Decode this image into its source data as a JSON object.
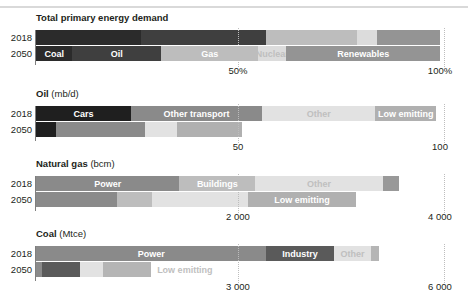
{
  "figure": {
    "rows": [
      "2018",
      "2050"
    ],
    "plot_left_px": 36,
    "plot_width_px": 404
  },
  "chart_data": [
    {
      "type": "bar",
      "orientation": "horizontal",
      "stacked": true,
      "title": "Total primary energy demand",
      "unit": "",
      "xlabel": "",
      "ylabel": "",
      "xlim": [
        0,
        100
      ],
      "ticks": [
        {
          "value": 50,
          "label": "50%"
        },
        {
          "value": 100,
          "label": "100%"
        }
      ],
      "grid": true,
      "categories": [
        "2018",
        "2050"
      ],
      "series": [
        {
          "name": "Coal",
          "values": [
            26.0,
            9.0
          ],
          "color": "#2b2b2b"
        },
        {
          "name": "Oil",
          "values": [
            31.0,
            22.0
          ],
          "color": "#3f3f3f"
        },
        {
          "name": "Gas",
          "values": [
            22.5,
            24.0
          ],
          "color": "#bdbdbd"
        },
        {
          "name": "Nuclear",
          "values": [
            5.0,
            7.0
          ],
          "color": "#dcdcdc"
        },
        {
          "name": "Renewables",
          "values": [
            15.5,
            38.0
          ],
          "color": "#949494"
        }
      ]
    },
    {
      "type": "bar",
      "orientation": "horizontal",
      "stacked": true,
      "title": "Oil",
      "unit": "(mb/d)",
      "xlabel": "",
      "ylabel": "",
      "xlim": [
        0,
        100
      ],
      "ticks": [
        {
          "value": 50,
          "label": "50"
        },
        {
          "value": 100,
          "label": "100"
        }
      ],
      "grid": true,
      "categories": [
        "2018",
        "2050"
      ],
      "series": [
        {
          "name": "Cars",
          "values": [
            23.5,
            5.0
          ],
          "color": "#1f1f1f"
        },
        {
          "name": "Other transport",
          "values": [
            32.5,
            22.0
          ],
          "color": "#8a8a8a"
        },
        {
          "name": "Other",
          "values": [
            28.0,
            8.0
          ],
          "color": "#e2e2e2"
        },
        {
          "name": "Low emitting",
          "values": [
            15.0,
            16.0
          ],
          "color": "#b0b0b0"
        }
      ]
    },
    {
      "type": "bar",
      "orientation": "horizontal",
      "stacked": true,
      "title": "Natural gas",
      "unit": "(bcm)",
      "xlabel": "",
      "ylabel": "",
      "xlim": [
        0,
        4000
      ],
      "ticks": [
        {
          "value": 2000,
          "label": "2 000"
        },
        {
          "value": 4000,
          "label": "4 000"
        }
      ],
      "grid": true,
      "categories": [
        "2018",
        "2050"
      ],
      "series": [
        {
          "name": "Power",
          "values": [
            1420,
            800
          ],
          "color": "#8a8a8a"
        },
        {
          "name": "Buildings",
          "values": [
            750,
            350
          ],
          "color": "#bdbdbd"
        },
        {
          "name": "Other",
          "values": [
            1260,
            950
          ],
          "color": "#e2e2e2"
        },
        {
          "name": "Low emitting",
          "values": [
            160,
            1070
          ],
          "color": "#b0b0b0"
        }
      ]
    },
    {
      "type": "bar",
      "orientation": "horizontal",
      "stacked": true,
      "title": "Coal",
      "unit": "(Mtce)",
      "xlabel": "",
      "ylabel": "",
      "xlim": [
        0,
        6000
      ],
      "ticks": [
        {
          "value": 3000,
          "label": "3 000"
        },
        {
          "value": 6000,
          "label": "6 000"
        }
      ],
      "grid": true,
      "categories": [
        "2018",
        "2050"
      ],
      "series": [
        {
          "name": "Power",
          "values": [
            3420,
            340
          ],
          "color": "#8a8a8a"
        },
        {
          "name": "Industry",
          "values": [
            1000,
            250
          ],
          "color": "#5a5a5a"
        },
        {
          "name": "Other",
          "values": [
            560,
            730
          ],
          "color": "#e2e2e2"
        },
        {
          "name": "Low emitting",
          "values": [
            0,
            0
          ],
          "color": "#b0b0b0"
        }
      ]
    }
  ],
  "panels": [
    {
      "title_bold": "Total primary energy demand",
      "title_unit": "",
      "rows": [
        {
          "year": "2018",
          "segments": [
            {
              "label": "",
              "start_pct": 0,
              "end_pct": 26.0,
              "color": "#2b2b2b",
              "show_label": false
            },
            {
              "label": "",
              "start_pct": 26.0,
              "end_pct": 57.0,
              "color": "#3f3f3f",
              "show_label": false
            },
            {
              "label": "",
              "start_pct": 57.0,
              "end_pct": 79.5,
              "color": "#bdbdbd",
              "show_label": false
            },
            {
              "label": "",
              "start_pct": 79.5,
              "end_pct": 84.5,
              "color": "#dcdcdc",
              "show_label": false
            },
            {
              "label": "",
              "start_pct": 84.5,
              "end_pct": 100.0,
              "color": "#949494",
              "show_label": false
            }
          ]
        },
        {
          "year": "2050",
          "segments": [
            {
              "label": "Coal",
              "start_pct": 0,
              "end_pct": 9.0,
              "color": "#2b2b2b",
              "show_label": true
            },
            {
              "label": "Oil",
              "start_pct": 9.0,
              "end_pct": 31.0,
              "color": "#3f3f3f",
              "show_label": true
            },
            {
              "label": "Gas",
              "start_pct": 31.0,
              "end_pct": 55.0,
              "color": "#bdbdbd",
              "show_label": true
            },
            {
              "label": "Nuclear",
              "start_pct": 55.0,
              "end_pct": 62.0,
              "color": "#dcdcdc",
              "show_label": true
            },
            {
              "label": "Renewables",
              "start_pct": 62.0,
              "end_pct": 100.0,
              "color": "#949494",
              "show_label": true
            }
          ]
        }
      ],
      "ticks": [
        {
          "pos_pct": 50,
          "label": "50%"
        },
        {
          "pos_pct": 100,
          "label": "100%"
        }
      ],
      "gridlines": [
        50
      ]
    },
    {
      "title_bold": "Oil",
      "title_unit": "(mb/d)",
      "rows": [
        {
          "year": "2018",
          "segments": [
            {
              "label": "Cars",
              "start_pct": 0,
              "end_pct": 23.5,
              "color": "#1f1f1f",
              "show_label": true
            },
            {
              "label": "Other transport",
              "start_pct": 23.5,
              "end_pct": 56.0,
              "color": "#8a8a8a",
              "show_label": true
            },
            {
              "label": "Other",
              "start_pct": 56.0,
              "end_pct": 84.0,
              "color": "#e2e2e2",
              "show_label": true
            },
            {
              "label": "Low emitting",
              "start_pct": 84.0,
              "end_pct": 99.0,
              "color": "#b0b0b0",
              "show_label": true
            }
          ]
        },
        {
          "year": "2050",
          "segments": [
            {
              "label": "",
              "start_pct": 0,
              "end_pct": 5.0,
              "color": "#1f1f1f",
              "show_label": false
            },
            {
              "label": "",
              "start_pct": 5.0,
              "end_pct": 27.0,
              "color": "#8a8a8a",
              "show_label": false
            },
            {
              "label": "",
              "start_pct": 27.0,
              "end_pct": 35.0,
              "color": "#e2e2e2",
              "show_label": false
            },
            {
              "label": "",
              "start_pct": 35.0,
              "end_pct": 51.0,
              "color": "#b0b0b0",
              "show_label": false
            }
          ]
        }
      ],
      "ticks": [
        {
          "pos_pct": 50,
          "label": "50"
        },
        {
          "pos_pct": 100,
          "label": "100"
        }
      ],
      "gridlines": [
        50
      ]
    },
    {
      "title_bold": "Natural gas",
      "title_unit": "(bcm)",
      "rows": [
        {
          "year": "2018",
          "segments": [
            {
              "label": "Power",
              "start_pct": 0,
              "end_pct": 35.5,
              "color": "#8a8a8a",
              "show_label": true
            },
            {
              "label": "Buildings",
              "start_pct": 35.5,
              "end_pct": 54.3,
              "color": "#bdbdbd",
              "show_label": true
            },
            {
              "label": "Other",
              "start_pct": 54.3,
              "end_pct": 85.8,
              "color": "#e2e2e2",
              "show_label": true
            },
            {
              "label": "",
              "start_pct": 85.8,
              "end_pct": 89.8,
              "color": "#999999",
              "show_label": false
            }
          ]
        },
        {
          "year": "2050",
          "segments": [
            {
              "label": "",
              "start_pct": 0,
              "end_pct": 20.0,
              "color": "#8a8a8a",
              "show_label": false
            },
            {
              "label": "",
              "start_pct": 20.0,
              "end_pct": 28.8,
              "color": "#bdbdbd",
              "show_label": false
            },
            {
              "label": "",
              "start_pct": 28.8,
              "end_pct": 52.5,
              "color": "#e2e2e2",
              "show_label": false
            },
            {
              "label": "Low emitting",
              "start_pct": 52.5,
              "end_pct": 79.2,
              "color": "#b0b0b0",
              "show_label": true
            }
          ]
        }
      ],
      "ticks": [
        {
          "pos_pct": 50,
          "label": "2 000"
        },
        {
          "pos_pct": 100,
          "label": "4 000"
        }
      ],
      "gridlines": [
        50
      ]
    },
    {
      "title_bold": "Coal",
      "title_unit": "(Mtce)",
      "rows": [
        {
          "year": "2018",
          "segments": [
            {
              "label": "Power",
              "start_pct": 0,
              "end_pct": 57.0,
              "color": "#8a8a8a",
              "show_label": true
            },
            {
              "label": "Industry",
              "start_pct": 57.0,
              "end_pct": 73.7,
              "color": "#5a5a5a",
              "show_label": true
            },
            {
              "label": "Other",
              "start_pct": 73.7,
              "end_pct": 83.0,
              "color": "#e2e2e2",
              "show_label": true
            },
            {
              "label": "",
              "start_pct": 83.0,
              "end_pct": 85.0,
              "color": "#b5b5b5",
              "show_label": false
            }
          ]
        },
        {
          "year": "2050",
          "segments": [
            {
              "label": "",
              "start_pct": 0,
              "end_pct": 1.5,
              "color": "#8a8a8a",
              "show_label": false
            },
            {
              "label": "",
              "start_pct": 1.5,
              "end_pct": 11.0,
              "color": "#5a5a5a",
              "show_label": false
            },
            {
              "label": "",
              "start_pct": 11.0,
              "end_pct": 16.5,
              "color": "#e2e2e2",
              "show_label": false
            },
            {
              "label": "",
              "start_pct": 16.5,
              "end_pct": 28.5,
              "color": "#b5b5b5",
              "show_label": false
            },
            {
              "label": "Low emitting",
              "start_pct": 28.5,
              "end_pct": 28.5,
              "color": "transparent",
              "show_label": true,
              "outside_label": true
            }
          ]
        }
      ],
      "ticks": [
        {
          "pos_pct": 50,
          "label": "3 000"
        },
        {
          "pos_pct": 100,
          "label": "6 000"
        }
      ],
      "gridlines": [
        50
      ]
    }
  ]
}
